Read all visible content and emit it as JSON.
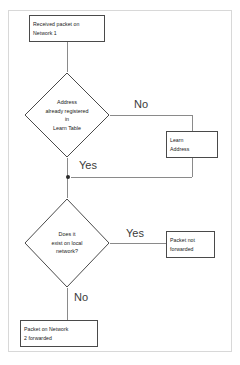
{
  "diagram": {
    "type": "flowchart",
    "frame": {
      "border_color": "#d8d8d8"
    },
    "colors": {
      "node_border": "#4a4a4a",
      "node_fill": "#ffffff",
      "connector": "#8a8a8a",
      "text": "#222222",
      "label_text": "#3a3a3a"
    },
    "nodes": [
      {
        "id": "start",
        "shape": "process",
        "name": "received-packet-box",
        "lines": [
          "Received packet on",
          "Network 1"
        ]
      },
      {
        "id": "decision-learn",
        "shape": "decision",
        "name": "address-registered-decision",
        "lines": [
          "Address",
          "already registered",
          "in",
          "Learn Table"
        ]
      },
      {
        "id": "learn-address",
        "shape": "process",
        "name": "learn-address-box",
        "lines": [
          "Learn",
          "Address"
        ]
      },
      {
        "id": "decision-local",
        "shape": "decision",
        "name": "local-network-decision",
        "lines": [
          "Does it",
          "exist on local",
          "network?"
        ]
      },
      {
        "id": "not-forwarded",
        "shape": "process",
        "name": "packet-not-forwarded-box",
        "lines": [
          "Packet not",
          "forwarded"
        ]
      },
      {
        "id": "forwarded",
        "shape": "process",
        "name": "packet-forwarded-box",
        "lines": [
          "Packet on Network",
          "2 forwarded"
        ]
      }
    ],
    "edge_labels": [
      {
        "id": "no-learn",
        "name": "edge-label-no-learn",
        "text": "No"
      },
      {
        "id": "yes-learn",
        "name": "edge-label-yes-learn",
        "text": "Yes"
      },
      {
        "id": "yes-local",
        "name": "edge-label-yes-local",
        "text": "Yes"
      },
      {
        "id": "no-local",
        "name": "edge-label-no-local",
        "text": "No"
      }
    ],
    "edges": [
      {
        "from": "start",
        "to": "decision-learn",
        "label": ""
      },
      {
        "from": "decision-learn",
        "to": "learn-address",
        "label": "No"
      },
      {
        "from": "learn-address",
        "to": "junction",
        "label": ""
      },
      {
        "from": "decision-learn",
        "to": "decision-local",
        "label": "Yes"
      },
      {
        "from": "decision-local",
        "to": "not-forwarded",
        "label": "Yes"
      },
      {
        "from": "decision-local",
        "to": "forwarded",
        "label": "No"
      }
    ]
  }
}
